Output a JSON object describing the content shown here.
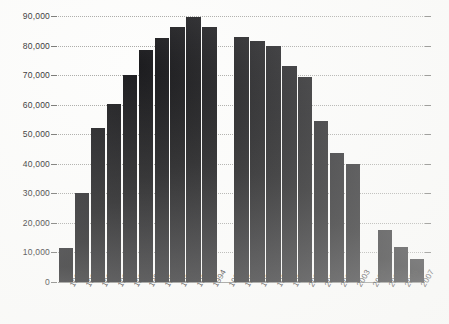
{
  "chart_data": {
    "type": "bar",
    "title": "",
    "subtitle": "",
    "xlabel": "",
    "ylabel": "",
    "categories": [
      "1985",
      "1986",
      "1987",
      "1988",
      "1989",
      "1990",
      "1991",
      "1992",
      "1993",
      "1994",
      "1995",
      "1996",
      "1997",
      "1998",
      "1999",
      "2000",
      "2001",
      "2002",
      "2003",
      "2004",
      "2005",
      "2006",
      "2007"
    ],
    "values": [
      11500,
      30200,
      52000,
      60300,
      70000,
      78500,
      82600,
      86400,
      89500,
      86400,
      null,
      82900,
      81500,
      79800,
      73000,
      69400,
      54500,
      43700,
      39800,
      null,
      17700,
      11700,
      7700
    ],
    "ylim": [
      0,
      90000
    ],
    "ytick_labels": [
      "0",
      "10,000",
      "20,000",
      "30,000",
      "40,000",
      "50,000",
      "60,000",
      "70,000",
      "80,000",
      "90,000"
    ],
    "ytick_values": [
      0,
      10000,
      20000,
      30000,
      40000,
      50000,
      60000,
      70000,
      80000,
      90000
    ],
    "grid": true,
    "grid_style": "dotted",
    "legend": "none",
    "bar_color": "#17171a",
    "background_color": "#fdfdfc",
    "grid_color": "#9a9a96",
    "axis_color": "#7b7b78",
    "missing_categories": [
      "1995",
      "2004"
    ],
    "annotations": []
  }
}
